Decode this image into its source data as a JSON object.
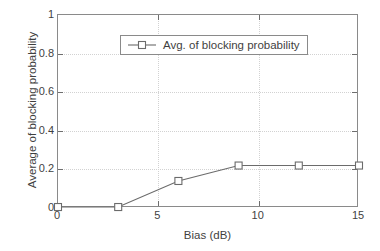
{
  "chart_data": {
    "type": "line",
    "title": "",
    "xlabel": "Bias (dB)",
    "ylabel": "Average of blocking probability",
    "xlim": [
      0,
      15
    ],
    "ylim": [
      0,
      1
    ],
    "xticks": [
      "0",
      "5",
      "10",
      "15"
    ],
    "xtick_values": [
      0,
      5,
      10,
      15
    ],
    "yticks": [
      "0",
      "0.2",
      "0.4",
      "0.6",
      "0.8",
      "1"
    ],
    "ytick_values": [
      0,
      0.2,
      0.4,
      0.6,
      0.8,
      1
    ],
    "grid": true,
    "legend_position": "upper left",
    "series": [
      {
        "name": "Avg. of blocking probability",
        "marker": "square",
        "color": "#6b6b6b",
        "x": [
          0,
          3,
          6,
          9,
          12,
          15
        ],
        "values": [
          0.005,
          0.005,
          0.14,
          0.22,
          0.22,
          0.22
        ]
      }
    ]
  },
  "legend": {
    "entries": [
      {
        "label": "Avg. of blocking probability"
      }
    ]
  },
  "axes": {
    "x_title": "Bias (dB)",
    "y_title": "Average of blocking probability"
  }
}
